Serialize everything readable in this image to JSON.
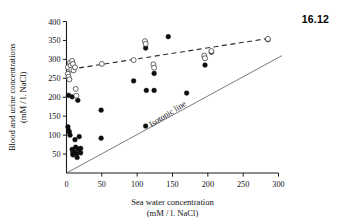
{
  "figure": {
    "number": "16.12"
  },
  "chart_data": {
    "type": "scatter",
    "title": "",
    "xlabel": "Sea water concentration",
    "xlabel_units": "(mM / l. NaCl)",
    "ylabel": "Blood and urine concentrations",
    "ylabel_units": "(mM / l. NaCl)",
    "xlim": [
      0,
      300
    ],
    "ylim": [
      0,
      400
    ],
    "xticks": [
      0,
      50,
      100,
      150,
      200,
      250,
      300
    ],
    "xticklabels": [
      "0",
      "50",
      "100",
      "150",
      "200",
      "250",
      "300"
    ],
    "yticks": [
      50,
      100,
      150,
      200,
      250,
      300,
      350,
      400
    ],
    "yticklabels": [
      "50",
      "100",
      "150",
      "200",
      "250",
      "300",
      "350",
      "400"
    ],
    "grid": false,
    "legend": "none",
    "annotations": [
      {
        "text": "Isotonic line",
        "x": 145,
        "y": 150,
        "rotation": -32
      }
    ],
    "lines": [
      {
        "name": "isotonic-line",
        "style": "solid",
        "color": "#6b6b6b",
        "x": [
          0,
          305
        ],
        "y": [
          0,
          310
        ]
      },
      {
        "name": "urine-trend-line",
        "style": "dashed",
        "color": "#2a2a2a",
        "x": [
          6,
          288
        ],
        "y": [
          274,
          356
        ]
      }
    ],
    "series": [
      {
        "name": "Blood (filled circles)",
        "marker": "filled-circle",
        "color": "#0d0d0d",
        "points": [
          [
            2,
            122
          ],
          [
            3,
            205
          ],
          [
            3,
            112
          ],
          [
            4,
            108
          ],
          [
            5,
            100
          ],
          [
            8,
            201
          ],
          [
            8,
            62
          ],
          [
            9,
            53
          ],
          [
            9,
            48
          ],
          [
            11,
            55
          ],
          [
            12,
            88
          ],
          [
            13,
            68
          ],
          [
            14,
            52
          ],
          [
            15,
            41
          ],
          [
            16,
            192
          ],
          [
            17,
            63
          ],
          [
            18,
            96
          ],
          [
            20,
            65
          ],
          [
            20,
            53
          ],
          [
            49,
            166
          ],
          [
            49,
            92
          ],
          [
            95,
            243
          ],
          [
            112,
            330
          ],
          [
            112,
            124
          ],
          [
            113,
            218
          ],
          [
            124,
            263
          ],
          [
            124,
            218
          ],
          [
            144,
            360
          ],
          [
            170,
            211
          ],
          [
            195,
            307
          ],
          [
            196,
            285
          ],
          [
            205,
            319
          ],
          [
            285,
            352
          ]
        ]
      },
      {
        "name": "Urine (open circles)",
        "marker": "open-circle",
        "color": "#ffffff",
        "points": [
          [
            2,
            279
          ],
          [
            2,
            262
          ],
          [
            3,
            254
          ],
          [
            4,
            247
          ],
          [
            5,
            291
          ],
          [
            6,
            284
          ],
          [
            7,
            273
          ],
          [
            8,
            296
          ],
          [
            9,
            288
          ],
          [
            10,
            271
          ],
          [
            12,
            279
          ],
          [
            13,
            222
          ],
          [
            14,
            204
          ],
          [
            50,
            288
          ],
          [
            95,
            298
          ],
          [
            111,
            348
          ],
          [
            112,
            341
          ],
          [
            123,
            287
          ],
          [
            124,
            278
          ],
          [
            195,
            310
          ],
          [
            196,
            303
          ],
          [
            205,
            322
          ],
          [
            285,
            354
          ]
        ]
      }
    ]
  }
}
